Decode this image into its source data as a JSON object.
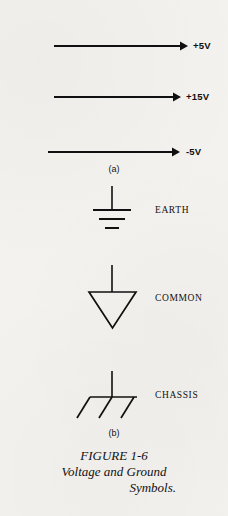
{
  "figure": {
    "background_color": "#f4f2ef",
    "ink_color": "#111010",
    "caption": {
      "line1": "FIGURE 1-6",
      "line2": "Voltage and Ground",
      "line3": "Symbols."
    },
    "group_labels": {
      "a": "(a)",
      "b": "(b)"
    },
    "voltage_arrows": [
      {
        "label": "+5V",
        "x1": 54,
        "x2": 186,
        "y": 46
      },
      {
        "label": "+15V",
        "x1": 54,
        "x2": 179,
        "y": 97
      },
      {
        "label": "-5V",
        "x1": 48,
        "x2": 178,
        "y": 152
      }
    ],
    "ground_symbols": [
      {
        "name": "earth-ground-symbol",
        "label": "EARTH"
      },
      {
        "name": "common-ground-symbol",
        "label": "COMMON"
      },
      {
        "name": "chassis-ground-symbol",
        "label": "CHASSIS"
      }
    ]
  }
}
